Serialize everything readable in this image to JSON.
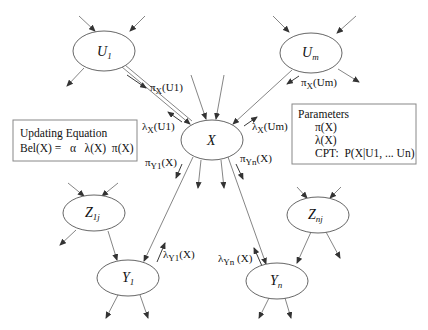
{
  "diagram": {
    "nodes": {
      "U1": {
        "main": "U",
        "sub": "1",
        "cx": 104,
        "cy": 51
      },
      "Um": {
        "main": "U",
        "sub": "m",
        "cx": 311,
        "cy": 53
      },
      "X": {
        "main": "X",
        "sub": "",
        "cx": 212,
        "cy": 140
      },
      "Z1j": {
        "main": "Z",
        "sub": "1j",
        "cx": 94,
        "cy": 213
      },
      "Znj": {
        "main": "Z",
        "sub": "nj",
        "cx": 318,
        "cy": 215
      },
      "Y1": {
        "main": "Y",
        "sub": "1",
        "cx": 128,
        "cy": 278
      },
      "Yn": {
        "main": "Y",
        "sub": "n",
        "cx": 277,
        "cy": 281
      }
    },
    "messages": {
      "pi_x_u1": {
        "sym": "π",
        "sub": "X",
        "arg": "(U1)"
      },
      "lambda_x_u1": {
        "sym": "λ",
        "sub": "X",
        "arg": "(U1)"
      },
      "pi_x_um": {
        "sym": "π",
        "sub": "X",
        "arg": "(Um)"
      },
      "lambda_x_um": {
        "sym": "λ",
        "sub": "X",
        "arg": "(Um)"
      },
      "pi_y1_x": {
        "sym": "π",
        "sub": "Y1",
        "arg": "(X)"
      },
      "pi_yn_x": {
        "sym": "π",
        "sub": "Yn",
        "arg": "(X)"
      },
      "lambda_y1_x": {
        "sym": "λ",
        "sub": "Y1",
        "arg": "(X)"
      },
      "lambda_yn_x": {
        "sym": "λ",
        "sub": "Yn",
        "arg": " (X)"
      }
    },
    "updating_box": {
      "title": "Updating Equation",
      "equation": "Bel(X) =   α   λ(X)  π(X)"
    },
    "parameters_box": {
      "title": "Parameters",
      "items": [
        "π(X)",
        "λ(X)",
        "CPT:  P(X|U1, ... Un)"
      ]
    }
  }
}
